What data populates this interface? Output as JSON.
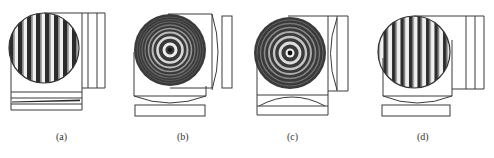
{
  "figure": {
    "line_color": "#3a3a3a",
    "fringe_dark": "#2a2a2a",
    "fringe_light": "#e8e8e8",
    "panels": [
      {
        "id": "a",
        "label": "(a)",
        "pattern": "straight-fringes",
        "label_x": 62
      },
      {
        "id": "b",
        "label": "(b)",
        "pattern": "concentric-rings",
        "label_x": 185
      },
      {
        "id": "c",
        "label": "(c)",
        "pattern": "concentric-rings",
        "label_x": 293
      },
      {
        "id": "d",
        "label": "(d)",
        "pattern": "straight-fringes",
        "label_x": 423
      }
    ]
  }
}
